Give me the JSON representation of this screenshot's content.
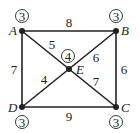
{
  "graph": {
    "vertices": [
      {
        "id": "A",
        "label": "A",
        "degree": "3"
      },
      {
        "id": "B",
        "label": "B",
        "degree": "3"
      },
      {
        "id": "C",
        "label": "C",
        "degree": "3"
      },
      {
        "id": "D",
        "label": "D",
        "degree": "3"
      },
      {
        "id": "E",
        "label": "E",
        "degree": "4"
      }
    ],
    "edges": [
      {
        "from": "A",
        "to": "B",
        "weight": "8"
      },
      {
        "from": "A",
        "to": "E",
        "weight": "5"
      },
      {
        "from": "B",
        "to": "E",
        "weight": "6"
      },
      {
        "from": "B",
        "to": "C",
        "weight": "6"
      },
      {
        "from": "A",
        "to": "D",
        "weight": "7"
      },
      {
        "from": "D",
        "to": "E",
        "weight": "4"
      },
      {
        "from": "E",
        "to": "C",
        "weight": "7"
      },
      {
        "from": "D",
        "to": "C",
        "weight": "9"
      }
    ]
  },
  "colors": {
    "line": "#222222",
    "background": "#ffffff"
  }
}
